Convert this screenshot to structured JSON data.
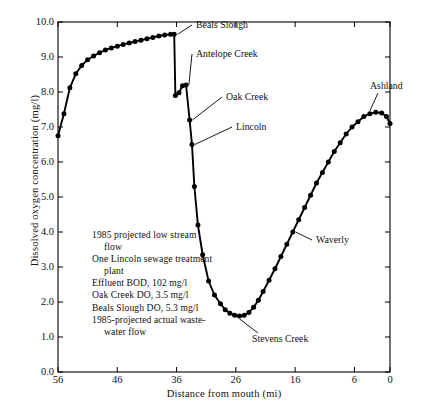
{
  "chart_data": {
    "type": "line",
    "title": "",
    "xlabel": "Distance from mouth (mi)",
    "ylabel": "Dissolved oxygen concentration (mg/l)",
    "xlim": [
      56,
      0
    ],
    "ylim": [
      0.0,
      10.0
    ],
    "x_ticks": [
      "56",
      "46",
      "36",
      "26",
      "16",
      "6",
      "0"
    ],
    "x_tick_values": [
      56,
      46,
      36,
      26,
      16,
      6,
      0
    ],
    "y_ticks": [
      "0.0",
      "1.0",
      "2.0",
      "3.0",
      "4.0",
      "5.0",
      "6.0",
      "7.0",
      "8.0",
      "9.0",
      "10.0"
    ],
    "y_tick_values": [
      0,
      1,
      2,
      3,
      4,
      5,
      6,
      7,
      8,
      9,
      10
    ],
    "grid": false,
    "legend": "none",
    "x": [
      56,
      55,
      54,
      53,
      52,
      51,
      50,
      49,
      48,
      47,
      46,
      45,
      44,
      43,
      42,
      41,
      40,
      39,
      38,
      37,
      36.4,
      36.2,
      35.6,
      35.0,
      34.4,
      33.8,
      33.4,
      33.0,
      32.4,
      31.6,
      30.6,
      29.6,
      28.6,
      27.8,
      27.0,
      26.2,
      25.4,
      24.6,
      23.8,
      23.0,
      22.2,
      21.4,
      20.4,
      19.4,
      18.4,
      17.4,
      16.4,
      15.4,
      14.4,
      13.4,
      12.4,
      11.4,
      10.4,
      9.4,
      8.4,
      7.4,
      6.4,
      5.4,
      4.4,
      3.4,
      2.4,
      1.4,
      0.6,
      0
    ],
    "y": [
      6.75,
      7.38,
      8.12,
      8.52,
      8.76,
      8.92,
      9.03,
      9.12,
      9.2,
      9.26,
      9.31,
      9.36,
      9.4,
      9.44,
      9.48,
      9.52,
      9.56,
      9.6,
      9.63,
      9.65,
      9.65,
      7.9,
      7.98,
      8.18,
      8.2,
      7.2,
      6.5,
      5.3,
      4.2,
      3.35,
      2.6,
      2.2,
      1.95,
      1.78,
      1.68,
      1.62,
      1.6,
      1.62,
      1.7,
      1.85,
      2.05,
      2.3,
      2.62,
      2.95,
      3.3,
      3.65,
      4.0,
      4.35,
      4.7,
      5.05,
      5.4,
      5.7,
      6.0,
      6.3,
      6.55,
      6.8,
      7.0,
      7.15,
      7.3,
      7.38,
      7.42,
      7.4,
      7.3,
      7.1
    ],
    "annotations": [
      {
        "label": "Beals Slough",
        "x": 36.4,
        "y": 9.65
      },
      {
        "label": "Antelope Creek",
        "x": 34.4,
        "y": 8.2
      },
      {
        "label": "Oak Creek",
        "x": 33.8,
        "y": 7.2
      },
      {
        "label": "Lincoln",
        "x": 33.4,
        "y": 6.5
      },
      {
        "label": "Stevens Creek",
        "x": 25.4,
        "y": 1.6
      },
      {
        "label": "Waverly",
        "x": 16.4,
        "y": 4.0
      },
      {
        "label": "Ashland",
        "x": 3.4,
        "y": 7.38
      }
    ],
    "note_lines": [
      {
        "text": "1985 projected low stream",
        "indent": false
      },
      {
        "text": "flow",
        "indent": true
      },
      {
        "text": "One Lincoln sewage treatment",
        "indent": false
      },
      {
        "text": "plant",
        "indent": true
      },
      {
        "text": "Effluent BOD, 102 mg/l",
        "indent": false
      },
      {
        "text": "Oak Creek DO, 3.5 mg/l",
        "indent": false
      },
      {
        "text": "Beals Slough DO, 5.3 mg/l",
        "indent": false
      },
      {
        "text": "1985-projected actual waste-",
        "indent": false
      },
      {
        "text": "water flow",
        "indent": true
      }
    ],
    "colors": {
      "line": "#000000",
      "marker": "#000000",
      "axis": "#000000",
      "background": "#ffffff"
    }
  }
}
